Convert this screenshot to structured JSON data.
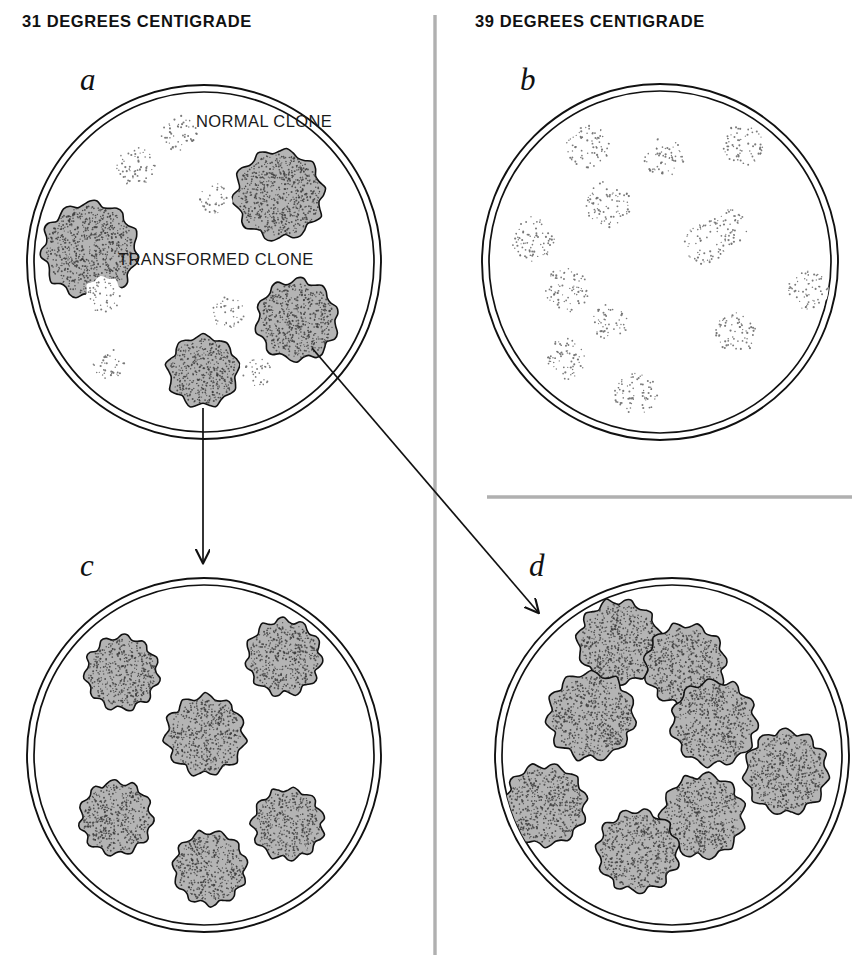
{
  "figure": {
    "title_left": "31 DEGREES CENTIGRADE",
    "title_right": "39 DEGREES CENTIGRADE",
    "colors": {
      "ink": "#111111",
      "transformed_fill": "#b4b4b4",
      "transformed_stipple": "#3a3a3a",
      "normal_stipple": "#6d6d6d",
      "divider": "#9a9a9a",
      "background": "#ffffff"
    },
    "dividers": {
      "vertical": {
        "x": 435,
        "y1": 15,
        "y2": 955,
        "color": "#9a9a9a"
      },
      "horizontal": {
        "y": 497,
        "x1": 487,
        "x2": 852,
        "color": "#9a9a9a"
      }
    },
    "legend": [
      {
        "name": "normal-clone",
        "label": "NORMAL CLONE",
        "x": 196,
        "y": 112
      },
      {
        "name": "transformed-clone",
        "label": "TRANSFORMED CLONE",
        "x": 118,
        "y": 250
      }
    ],
    "arrows": [
      {
        "name": "arrow-a-to-c",
        "kind": "straight-down",
        "from_panel": "a",
        "to_panel": "c",
        "x1": 203,
        "y1": 408,
        "x2": 203,
        "y2": 562
      },
      {
        "name": "arrow-a-to-d",
        "kind": "diagonal",
        "from_panel": "a",
        "to_panel": "d",
        "x1": 312,
        "y1": 348,
        "x2": 538,
        "y2": 612
      }
    ],
    "panels": [
      {
        "id": "a",
        "letter": "a",
        "letter_x": 80,
        "letter_y": 62,
        "temperature": "31 DEGREES CENTIGRADE",
        "dish": {
          "cx": 204,
          "cy": 262,
          "r_outer": 177,
          "r_inner": 170
        },
        "transformed_count": 4,
        "normal_count": 7,
        "colonies": [
          {
            "type": "transformed",
            "cx": 90,
            "cy": 250,
            "r": 47,
            "lobes": 11,
            "seed": 11
          },
          {
            "type": "transformed",
            "cx": 279,
            "cy": 195,
            "r": 44,
            "lobes": 10,
            "seed": 23
          },
          {
            "type": "transformed",
            "cx": 297,
            "cy": 320,
            "r": 40,
            "lobes": 10,
            "seed": 37
          },
          {
            "type": "transformed",
            "cx": 203,
            "cy": 371,
            "r": 35,
            "lobes": 9,
            "seed": 41
          },
          {
            "type": "normal",
            "cx": 179,
            "cy": 133,
            "r": 20,
            "lobes": 8,
            "seed": 5
          },
          {
            "type": "normal",
            "cx": 135,
            "cy": 166,
            "r": 22,
            "lobes": 8,
            "seed": 13
          },
          {
            "type": "normal",
            "cx": 215,
            "cy": 198,
            "r": 17,
            "lobes": 7,
            "seed": 17
          },
          {
            "type": "normal",
            "cx": 104,
            "cy": 296,
            "r": 19,
            "lobes": 8,
            "seed": 29
          },
          {
            "type": "normal",
            "cx": 228,
            "cy": 313,
            "r": 18,
            "lobes": 8,
            "seed": 31
          },
          {
            "type": "normal",
            "cx": 108,
            "cy": 363,
            "r": 18,
            "lobes": 8,
            "seed": 43
          },
          {
            "type": "normal",
            "cx": 256,
            "cy": 373,
            "r": 17,
            "lobes": 7,
            "seed": 47
          }
        ]
      },
      {
        "id": "b",
        "letter": "b",
        "letter_x": 520,
        "letter_y": 62,
        "temperature": "39 DEGREES CENTIGRADE",
        "dish": {
          "cx": 660,
          "cy": 262,
          "r_outer": 178,
          "r_inner": 171
        },
        "transformed_count": 0,
        "normal_count": 12,
        "colonies": [
          {
            "type": "normal",
            "cx": 588,
            "cy": 146,
            "r": 24,
            "lobes": 9,
            "seed": 3
          },
          {
            "type": "normal",
            "cx": 664,
            "cy": 157,
            "r": 22,
            "lobes": 8,
            "seed": 7
          },
          {
            "type": "normal",
            "cx": 742,
            "cy": 145,
            "r": 23,
            "lobes": 8,
            "seed": 11
          },
          {
            "type": "normal",
            "cx": 608,
            "cy": 204,
            "r": 26,
            "lobes": 9,
            "seed": 19
          },
          {
            "type": "normal",
            "cx": 532,
            "cy": 239,
            "r": 25,
            "lobes": 9,
            "seed": 23
          },
          {
            "type": "normal",
            "cx": 706,
            "cy": 243,
            "r": 24,
            "lobes": 9,
            "seed": 29
          },
          {
            "type": "normal",
            "cx": 727,
            "cy": 229,
            "r": 22,
            "lobes": 8,
            "seed": 33
          },
          {
            "type": "normal",
            "cx": 566,
            "cy": 290,
            "r": 25,
            "lobes": 9,
            "seed": 37
          },
          {
            "type": "normal",
            "cx": 808,
            "cy": 290,
            "r": 22,
            "lobes": 8,
            "seed": 41
          },
          {
            "type": "normal",
            "cx": 610,
            "cy": 322,
            "r": 20,
            "lobes": 8,
            "seed": 47
          },
          {
            "type": "normal",
            "cx": 736,
            "cy": 333,
            "r": 23,
            "lobes": 9,
            "seed": 53
          },
          {
            "type": "normal",
            "cx": 567,
            "cy": 359,
            "r": 23,
            "lobes": 9,
            "seed": 59
          },
          {
            "type": "normal",
            "cx": 636,
            "cy": 394,
            "r": 24,
            "lobes": 9,
            "seed": 61
          }
        ]
      },
      {
        "id": "c",
        "letter": "c",
        "letter_x": 80,
        "letter_y": 548,
        "temperature": "31 DEGREES CENTIGRADE",
        "dish": {
          "cx": 204,
          "cy": 755,
          "r_outer": 177,
          "r_inner": 170
        },
        "transformed_count": 6,
        "normal_count": 0,
        "colonies": [
          {
            "type": "transformed",
            "cx": 122,
            "cy": 673,
            "r": 36,
            "lobes": 11,
            "seed": 5
          },
          {
            "type": "transformed",
            "cx": 284,
            "cy": 657,
            "r": 37,
            "lobes": 11,
            "seed": 13
          },
          {
            "type": "transformed",
            "cx": 205,
            "cy": 735,
            "r": 39,
            "lobes": 11,
            "seed": 23
          },
          {
            "type": "transformed",
            "cx": 116,
            "cy": 818,
            "r": 36,
            "lobes": 11,
            "seed": 31
          },
          {
            "type": "transformed",
            "cx": 288,
            "cy": 824,
            "r": 35,
            "lobes": 11,
            "seed": 43
          },
          {
            "type": "transformed",
            "cx": 210,
            "cy": 868,
            "r": 36,
            "lobes": 11,
            "seed": 53
          }
        ]
      },
      {
        "id": "d",
        "letter": "d",
        "letter_x": 529,
        "letter_y": 548,
        "temperature": "39 DEGREES CENTIGRADE",
        "dish": {
          "cx": 672,
          "cy": 755,
          "r_outer": 177,
          "r_inner": 170
        },
        "transformed_count": 8,
        "normal_count": 0,
        "colonies": [
          {
            "type": "transformed",
            "cx": 619,
            "cy": 642,
            "r": 41,
            "lobes": 11,
            "seed": 7
          },
          {
            "type": "transformed",
            "cx": 685,
            "cy": 665,
            "r": 40,
            "lobes": 11,
            "seed": 17
          },
          {
            "type": "transformed",
            "cx": 591,
            "cy": 716,
            "r": 43,
            "lobes": 11,
            "seed": 29
          },
          {
            "type": "transformed",
            "cx": 714,
            "cy": 723,
            "r": 42,
            "lobes": 11,
            "seed": 37
          },
          {
            "type": "transformed",
            "cx": 786,
            "cy": 772,
            "r": 41,
            "lobes": 11,
            "seed": 47
          },
          {
            "type": "transformed",
            "cx": 545,
            "cy": 805,
            "r": 40,
            "lobes": 11,
            "seed": 59
          },
          {
            "type": "transformed",
            "cx": 703,
            "cy": 816,
            "r": 41,
            "lobes": 11,
            "seed": 67
          },
          {
            "type": "transformed",
            "cx": 638,
            "cy": 851,
            "r": 40,
            "lobes": 11,
            "seed": 71
          }
        ]
      }
    ]
  }
}
